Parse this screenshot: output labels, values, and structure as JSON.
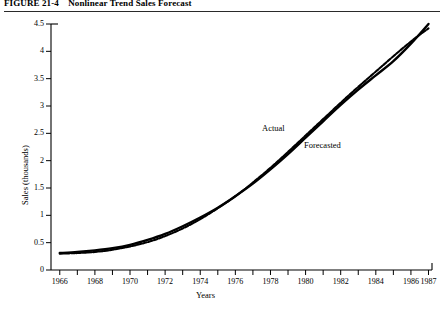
{
  "caption": {
    "figure_number": "FIGURE 21-4",
    "figure_title": "Nonlinear Trend Sales Forecast"
  },
  "annotations": {
    "actual_label": "Actual",
    "forecasted_label": "Forecasted"
  },
  "chart_data": {
    "type": "line",
    "title": "Nonlinear Trend Sales Forecast",
    "xlabel": "Years",
    "ylabel": "Sales (thousands)",
    "xlim": [
      1965.5,
      1987.2
    ],
    "ylim": [
      0,
      4.5
    ],
    "ytick_labels": [
      "0",
      "0.5",
      "1",
      "1.5",
      "2",
      "2.5",
      "3",
      "3.5",
      "4",
      "4.5"
    ],
    "ytick_values": [
      0,
      0.5,
      1,
      1.5,
      2,
      2.5,
      3,
      3.5,
      4,
      4.5
    ],
    "xtick_values": [
      1966,
      1967,
      1968,
      1969,
      1970,
      1971,
      1972,
      1973,
      1974,
      1975,
      1976,
      1977,
      1978,
      1979,
      1980,
      1981,
      1982,
      1983,
      1984,
      1985,
      1986,
      1987
    ],
    "xtick_labels": [
      "1966",
      "",
      "1968",
      "",
      "1970",
      "",
      "1972",
      "",
      "1974",
      "",
      "1976",
      "",
      "1978",
      "",
      "1980",
      "",
      "1982",
      "",
      "1984",
      "",
      "1986",
      "1987"
    ],
    "grid": false,
    "legend": "inline-annotations",
    "x": [
      1966,
      1967,
      1968,
      1969,
      1970,
      1971,
      1972,
      1973,
      1974,
      1975,
      1976,
      1977,
      1978,
      1979,
      1980,
      1981,
      1982,
      1983,
      1984,
      1985,
      1986,
      1987
    ],
    "series": [
      {
        "name": "Actual",
        "style": "solid",
        "values": [
          0.31,
          0.33,
          0.36,
          0.4,
          0.46,
          0.55,
          0.66,
          0.8,
          0.96,
          1.14,
          1.35,
          1.58,
          1.84,
          2.12,
          2.42,
          2.72,
          3.02,
          3.3,
          3.56,
          3.82,
          4.14,
          4.5
        ]
      },
      {
        "name": "Forecasted",
        "style": "dashed-overlay",
        "values": [
          0.3,
          0.31,
          0.33,
          0.37,
          0.43,
          0.51,
          0.62,
          0.76,
          0.93,
          1.13,
          1.35,
          1.6,
          1.87,
          2.16,
          2.46,
          2.76,
          3.06,
          3.35,
          3.63,
          3.91,
          4.18,
          4.42
        ]
      }
    ]
  }
}
